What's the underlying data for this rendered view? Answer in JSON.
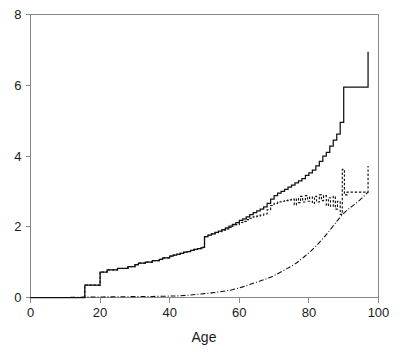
{
  "chart_data": {
    "type": "line",
    "title": "",
    "subtitle": "",
    "xlabel": "Age",
    "ylabel": "",
    "xlim": [
      0,
      100
    ],
    "ylim": [
      0,
      8
    ],
    "grid": false,
    "legend": "none",
    "xticks": [
      0,
      20,
      40,
      60,
      80,
      100
    ],
    "xtick_labels": [
      "0",
      "20",
      "40",
      "60",
      "80",
      "100"
    ],
    "yticks": [
      0,
      2,
      4,
      6,
      8
    ],
    "ytick_labels": [
      "0",
      "2",
      "4",
      "6",
      "8"
    ],
    "annotations": [],
    "series": [
      {
        "name": "solid-step-curve",
        "style": "solid",
        "drawstyle": "steps-post",
        "x": [
          0,
          5,
          15,
          15.6,
          18,
          20,
          22,
          25,
          28,
          30,
          31,
          33,
          35,
          37,
          38,
          40,
          41,
          42,
          43,
          44,
          45,
          46,
          47,
          48,
          49,
          49.5,
          50,
          51,
          52,
          53,
          54,
          55,
          56,
          57,
          58,
          59,
          60,
          61,
          62,
          63,
          64,
          65,
          66,
          67,
          68,
          69,
          70,
          71,
          72,
          73,
          74,
          75,
          76,
          77,
          78,
          79,
          80,
          81,
          82,
          83,
          84,
          85,
          86,
          87,
          88,
          89,
          90,
          91,
          96.5,
          97
        ],
        "y": [
          0,
          0,
          0,
          0.35,
          0.35,
          0.72,
          0.78,
          0.82,
          0.87,
          0.93,
          0.97,
          1.0,
          1.04,
          1.08,
          1.12,
          1.17,
          1.2,
          1.22,
          1.25,
          1.28,
          1.3,
          1.33,
          1.36,
          1.38,
          1.4,
          1.42,
          1.72,
          1.76,
          1.8,
          1.84,
          1.88,
          1.92,
          1.97,
          2.02,
          2.07,
          2.12,
          2.18,
          2.22,
          2.28,
          2.34,
          2.4,
          2.45,
          2.5,
          2.56,
          2.66,
          2.78,
          2.88,
          2.95,
          3.0,
          3.06,
          3.12,
          3.18,
          3.24,
          3.3,
          3.36,
          3.45,
          3.52,
          3.6,
          3.72,
          3.85,
          4.0,
          4.1,
          4.28,
          4.45,
          4.62,
          4.95,
          5.95,
          5.95,
          5.95,
          6.95
        ]
      },
      {
        "name": "dashed-curve",
        "style": "dashed",
        "drawstyle": "steps-post",
        "x": [
          0,
          5,
          15,
          15.6,
          18,
          20,
          22,
          25,
          28,
          30,
          31,
          33,
          35,
          37,
          38,
          40,
          41,
          42,
          43,
          44,
          45,
          46,
          47,
          48,
          49,
          49.5,
          50,
          51,
          52,
          53,
          54,
          55,
          56,
          57,
          58,
          59,
          60,
          61,
          62,
          63,
          64,
          65,
          66,
          67,
          68,
          69,
          70,
          71,
          72,
          73,
          74,
          75,
          75.8,
          76.4,
          77,
          77.6,
          78.2,
          79,
          79.6,
          80.2,
          81,
          81.6,
          82.2,
          83,
          83.6,
          84.2,
          85,
          85.6,
          86.2,
          87,
          87.6,
          88.2,
          89,
          89.6,
          90.2,
          90.6,
          91,
          96.6,
          97
        ],
        "y": [
          0,
          0,
          0,
          0.35,
          0.35,
          0.72,
          0.78,
          0.82,
          0.87,
          0.93,
          0.97,
          1.0,
          1.04,
          1.08,
          1.12,
          1.17,
          1.2,
          1.22,
          1.25,
          1.28,
          1.3,
          1.33,
          1.36,
          1.38,
          1.4,
          1.42,
          1.72,
          1.76,
          1.8,
          1.83,
          1.86,
          1.9,
          1.94,
          1.98,
          2.02,
          2.06,
          2.12,
          2.15,
          2.2,
          2.24,
          2.28,
          2.3,
          2.33,
          2.36,
          2.48,
          2.6,
          2.66,
          2.7,
          2.72,
          2.74,
          2.76,
          2.78,
          2.62,
          2.8,
          2.68,
          2.86,
          2.7,
          2.88,
          2.72,
          2.84,
          2.66,
          2.86,
          2.7,
          2.9,
          2.74,
          2.88,
          2.6,
          2.82,
          2.58,
          2.86,
          2.5,
          2.72,
          2.35,
          3.62,
          2.95,
          2.9,
          2.98,
          2.98,
          3.72
        ]
      },
      {
        "name": "dash-dot-curve",
        "style": "dashdot",
        "drawstyle": "smooth",
        "x": [
          0,
          5,
          10,
          15,
          20,
          25,
          30,
          35,
          40,
          43,
          46,
          49,
          52,
          55,
          58,
          61,
          64,
          67,
          70,
          73,
          76,
          79,
          82,
          85,
          88,
          90,
          92,
          94,
          96,
          97
        ],
        "y": [
          0,
          0,
          0.0,
          0.01,
          0.015,
          0.02,
          0.025,
          0.03,
          0.04,
          0.05,
          0.07,
          0.1,
          0.13,
          0.17,
          0.22,
          0.3,
          0.4,
          0.5,
          0.62,
          0.78,
          0.95,
          1.18,
          1.45,
          1.78,
          2.15,
          2.38,
          2.55,
          2.7,
          2.88,
          2.98
        ]
      }
    ]
  },
  "axis": {
    "x_title": "Age"
  },
  "colors": {
    "ink": "#111111",
    "frame": "#8a8a8a",
    "background": "#ffffff"
  }
}
